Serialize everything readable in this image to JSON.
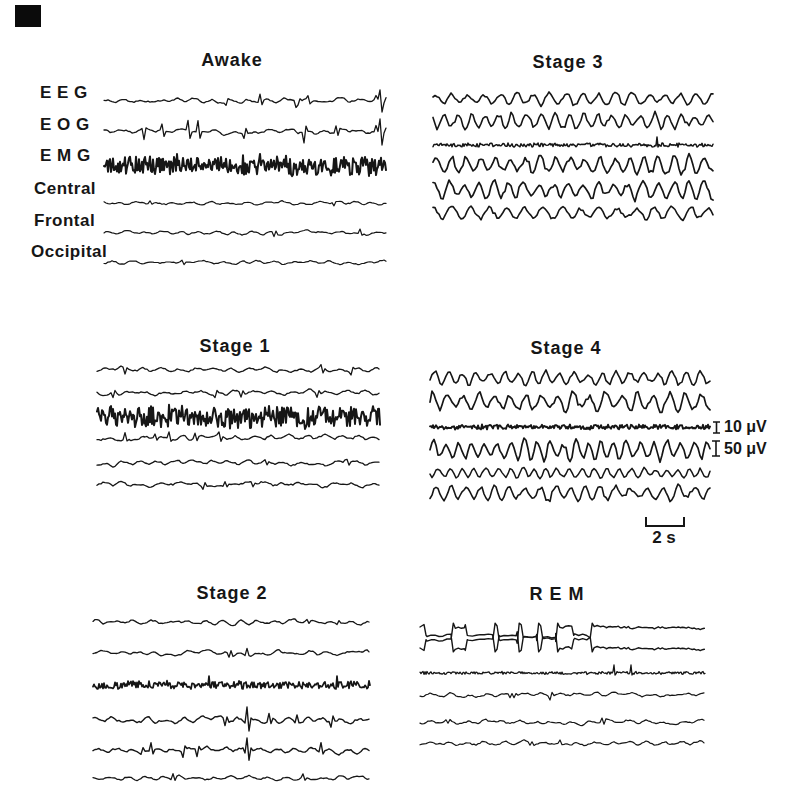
{
  "page": {
    "background": "#ffffff",
    "ink": "#161616"
  },
  "channels": {
    "eeg": "E E G",
    "eog": "E O G",
    "emg": "E M G",
    "central": "Central",
    "frontal": "Frontal",
    "occipital": "Occipital"
  },
  "scale": {
    "v_small": "10 μV",
    "v_large": "50 μV",
    "time": "2 s"
  },
  "panels": [
    {
      "title": "Awake",
      "traces": [
        {
          "kind": "eeg",
          "cy": 16,
          "amp": 3,
          "nSpikes": 5,
          "spikeAmp": 7,
          "endSpike": 11,
          "lw": 1.3,
          "seed": 11
        },
        {
          "kind": "eeg",
          "cy": 47,
          "amp": 3,
          "nSpikes": 7,
          "spikeAmp": 11,
          "endSpike": 13,
          "lw": 1.3,
          "seed": 22
        },
        {
          "kind": "emg",
          "cy": 80,
          "amp": 9,
          "lw": 2,
          "seed": 33
        },
        {
          "kind": "eeg",
          "cy": 118,
          "amp": 2.2,
          "nSpikes": 2,
          "spikeAmp": 4,
          "lw": 1.2,
          "seed": 44
        },
        {
          "kind": "eeg",
          "cy": 148,
          "amp": 2.2,
          "nSpikes": 2,
          "spikeAmp": 4,
          "lw": 1.2,
          "seed": 55
        },
        {
          "kind": "eeg",
          "cy": 178,
          "amp": 2.2,
          "nSpikes": 1,
          "spikeAmp": 4,
          "lw": 1.2,
          "seed": 66
        }
      ]
    },
    {
      "title": "Stage 1",
      "traces": [
        {
          "kind": "eeg",
          "cy": 10,
          "amp": 2.8,
          "nSpikes": 3,
          "spikeAmp": 5,
          "lw": 1.3,
          "seed": 101
        },
        {
          "kind": "eeg",
          "cy": 33,
          "amp": 3,
          "nSpikes": 4,
          "spikeAmp": 6,
          "lw": 1.3,
          "seed": 102
        },
        {
          "kind": "emg",
          "cy": 57,
          "amp": 10,
          "lw": 2,
          "seed": 103
        },
        {
          "kind": "eeg",
          "cy": 78,
          "amp": 3.2,
          "nSpikes": 5,
          "spikeAmp": 7,
          "lw": 1.3,
          "seed": 104
        },
        {
          "kind": "eeg",
          "cy": 103,
          "amp": 2.8,
          "nSpikes": 3,
          "spikeAmp": 5,
          "lw": 1.3,
          "seed": 105
        },
        {
          "kind": "eeg",
          "cy": 125,
          "amp": 3.2,
          "nSpikes": 3,
          "spikeAmp": 5,
          "lw": 1.3,
          "seed": 106
        }
      ]
    },
    {
      "title": "Stage 2",
      "traces": [
        {
          "kind": "eeg",
          "cy": 10,
          "amp": 2.8,
          "nSpikes": 2,
          "spikeAmp": 5,
          "lw": 1.3,
          "seed": 201
        },
        {
          "kind": "eeg",
          "cy": 41,
          "amp": 2.8,
          "nSpikes": 3,
          "spikeAmp": 6,
          "lw": 1.3,
          "seed": 202
        },
        {
          "kind": "emg",
          "cy": 73,
          "amp": 3.4,
          "spikes": [
            0.42,
            0.88
          ],
          "spikeAmp": 9,
          "lw": 1.7,
          "seed": 203
        },
        {
          "kind": "eeg",
          "cy": 108,
          "amp": 3.6,
          "nSpikes": 6,
          "spikeAmp": 8,
          "kx": 0.56,
          "kAmp": 13,
          "lw": 1.4,
          "seed": 204
        },
        {
          "kind": "eeg",
          "cy": 138,
          "amp": 3.2,
          "nSpikes": 5,
          "spikeAmp": 7,
          "kx": 0.56,
          "kAmp": 12,
          "lw": 1.4,
          "seed": 205
        },
        {
          "kind": "eeg",
          "cy": 166,
          "amp": 2.6,
          "nSpikes": 2,
          "spikeAmp": 4,
          "lw": 1.3,
          "seed": 206
        }
      ]
    },
    {
      "title": "Stage 3",
      "traces": [
        {
          "kind": "slow",
          "cy": 10,
          "amp": 6,
          "period": 16,
          "lw": 1.6,
          "seed": 301
        },
        {
          "kind": "slow",
          "cy": 32,
          "amp": 8,
          "period": 14,
          "lw": 1.6,
          "seed": 302
        },
        {
          "kind": "flat",
          "cy": 56,
          "amp": 1.7,
          "spikes": [
            0.8
          ],
          "spikeAmp": 8,
          "lw": 1.5,
          "seed": 303
        },
        {
          "kind": "slow",
          "cy": 76,
          "amp": 10,
          "period": 15,
          "lw": 1.7,
          "seed": 304
        },
        {
          "kind": "slow",
          "cy": 101,
          "amp": 9,
          "period": 15,
          "lw": 1.7,
          "seed": 305
        },
        {
          "kind": "slow",
          "cy": 124,
          "amp": 7,
          "period": 18,
          "lw": 1.6,
          "seed": 306
        }
      ]
    },
    {
      "title": "Stage 4",
      "traces": [
        {
          "kind": "slow",
          "cy": 10,
          "amp": 7,
          "period": 14,
          "lw": 1.6,
          "seed": 401
        },
        {
          "kind": "slow",
          "cy": 34,
          "amp": 10,
          "period": 16,
          "lw": 1.7,
          "seed": 402
        },
        {
          "kind": "flat",
          "cy": 59,
          "amp": 2.1,
          "lw": 1.9,
          "seed": 403
        },
        {
          "kind": "slow",
          "cy": 82,
          "amp": 10,
          "period": 13,
          "lw": 1.7,
          "seed": 404
        },
        {
          "kind": "slow",
          "cy": 105,
          "amp": 5,
          "period": 12,
          "lw": 1.5,
          "seed": 405
        },
        {
          "kind": "slow",
          "cy": 125,
          "amp": 8,
          "period": 15,
          "lw": 1.6,
          "seed": 406
        }
      ]
    },
    {
      "title": "R E M",
      "traces": [
        {
          "kind": "rem",
          "cy": 12,
          "amp": 13,
          "dir": 1,
          "frac": 0.56,
          "lw": 1.4,
          "seed": 501
        },
        {
          "kind": "rem",
          "cy": 33,
          "amp": 13,
          "dir": -1,
          "frac": 0.56,
          "lw": 1.4,
          "seed": 501
        },
        {
          "kind": "flat",
          "cy": 58,
          "amp": 1.3,
          "spikes": [
            0.68,
            0.74
          ],
          "spikeAmp": 8,
          "lw": 1.3,
          "seed": 503
        },
        {
          "kind": "eeg",
          "cy": 80,
          "amp": 2.6,
          "nSpikes": 3,
          "spikeAmp": 5,
          "lw": 1.2,
          "seed": 504
        },
        {
          "kind": "eeg",
          "cy": 107,
          "amp": 2.6,
          "nSpikes": 2,
          "spikeAmp": 4,
          "lw": 1.2,
          "seed": 505
        },
        {
          "kind": "eeg",
          "cy": 128,
          "amp": 2.6,
          "nSpikes": 2,
          "spikeAmp": 4,
          "lw": 1.2,
          "seed": 506
        }
      ]
    }
  ],
  "chart_data": {
    "type": "line",
    "panels": [
      "Awake",
      "Stage 1",
      "Stage 2",
      "Stage 3",
      "Stage 4",
      "REM"
    ],
    "channels": [
      "EEG",
      "EOG",
      "EMG",
      "Central",
      "Frontal",
      "Occipital"
    ],
    "calibration": {
      "emg_scale_uV": 10,
      "eeg_scale_uV": 50,
      "time_scale_s": 2
    },
    "legend_position": "right of Stage 4 panel (amplitude bars); below Stage 4 panel (time bar)",
    "grid": false,
    "qualitative_series": {
      "Awake": "Low-voltage fast EEG with blink/eye-movement transients in EEG and EOG; EMG shows a thick solid band of high tonic muscle activity; Central/Frontal/Occipital low voltage.",
      "Stage 1": "Low-voltage mixed-frequency activity on all EEG channels; EMG still a thick high-activity band.",
      "Stage 2": "Low-voltage background with K-complex-like sharp transients on Central and Frontal traces; EMG band thinner/moderate.",
      "Stage 3": "High-amplitude slow (delta) waves on all EEG channels; EMG nearly flat with one brief twitch.",
      "Stage 4": "Continuous high-amplitude slow waves, largest on EOG/Central traces; EMG flat dark line (10 μV bar aligned to it; 50 μV bar aligned to Central).",
      "REM": "Large mirrored rapid-eye-movement deflections on the top two (EEG/EOG) traces for the first ~60% then quiescent; EMG atonia with two small twitches; remaining channels low voltage."
    }
  }
}
